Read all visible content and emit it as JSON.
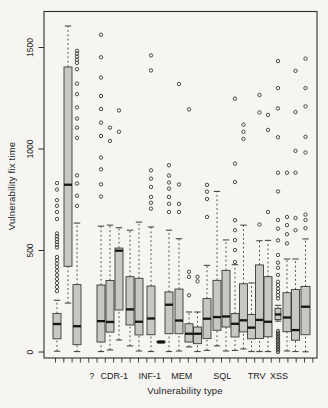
{
  "chart_data": {
    "type": "boxplot",
    "title": "",
    "xlabel": "Vulnerability type",
    "ylabel": "Vulnerability fix time",
    "ylim": [
      0,
      1680
    ],
    "grid": false,
    "legend": "none",
    "y_ticks": [
      0,
      500,
      1000,
      1500
    ],
    "categories": [
      {
        "label": "?",
        "x_px": 91.7
      },
      {
        "label": "CDR-1",
        "x_px": 114.3
      },
      {
        "label": "INF-1",
        "x_px": 149.7
      },
      {
        "label": "MEM",
        "x_px": 181.7
      },
      {
        "label": "SQL",
        "x_px": 222.3
      },
      {
        "label": "TRV",
        "x_px": 256.7
      },
      {
        "label": "XSS",
        "x_px": 279.0
      }
    ],
    "boxes": [
      {
        "group": "?",
        "x_px": 57,
        "width_px": 8,
        "whisker_low": 4,
        "q1": 65,
        "median": 138,
        "q3": 190,
        "whisker_high": 255,
        "outliers": [
          300,
          320,
          340,
          360,
          380,
          400,
          418,
          435,
          452,
          468,
          515,
          528,
          542,
          556,
          570,
          584,
          655,
          690,
          720,
          748,
          800,
          832
        ]
      },
      {
        "group": "?",
        "x_px": 68,
        "width_px": 8,
        "whisker_low": 241,
        "q1": 422,
        "median": 824,
        "q3": 1404,
        "whisker_high": 1606,
        "outliers": []
      },
      {
        "group": "?",
        "x_px": 77,
        "width_px": 8,
        "whisker_low": 2,
        "q1": 36,
        "median": 127,
        "q3": 332,
        "whisker_high": 635,
        "outliers": [
          720,
          770,
          830,
          870,
          1055,
          1105,
          1150,
          1205,
          1270,
          1322,
          1393,
          1424,
          1440,
          1455,
          1470,
          1484
        ]
      },
      {
        "group": "CDR-1",
        "x_px": 101,
        "width_px": 8,
        "whisker_low": 2,
        "q1": 49,
        "median": 152,
        "q3": 330,
        "whisker_high": 620,
        "outliers": [
          766,
          826,
          900,
          958,
          1064,
          1130,
          1197,
          1261,
          1352,
          1452,
          1563
        ]
      },
      {
        "group": "CDR-1",
        "x_px": 110,
        "width_px": 8,
        "whisker_low": 10,
        "q1": 98,
        "median": 148,
        "q3": 352,
        "whisker_high": 625,
        "outliers": [
          1040,
          1105
        ]
      },
      {
        "group": "CDR-1",
        "x_px": 119,
        "width_px": 8,
        "whisker_low": 59,
        "q1": 207,
        "median": 499,
        "q3": 512,
        "whisker_high": 612,
        "outliers": [
          1085,
          1190
        ]
      },
      {
        "group": "CDR-1",
        "x_px": 130,
        "width_px": 8,
        "whisker_low": 30,
        "q1": 133,
        "median": 210,
        "q3": 371,
        "whisker_high": 600,
        "outliers": []
      },
      {
        "group": "CDR-1",
        "x_px": 139,
        "width_px": 8,
        "whisker_low": 5,
        "q1": 84,
        "median": 149,
        "q3": 363,
        "whisker_high": 640,
        "outliers": []
      },
      {
        "group": "INF-1",
        "x_px": 151,
        "width_px": 8,
        "whisker_low": 2,
        "q1": 85,
        "median": 165,
        "q3": 325,
        "whisker_high": 616,
        "outliers": [
          706,
          735,
          764,
          813,
          854,
          895,
          1387,
          1461
        ]
      },
      {
        "group": "INF-1",
        "x_px": 161,
        "width_px": 8,
        "whisker_low": 44,
        "q1": 46,
        "median": 49,
        "q3": 53,
        "whisker_high": 55,
        "outliers": []
      },
      {
        "group": "INF-1",
        "x_px": 169,
        "width_px": 8,
        "whisker_low": 2,
        "q1": 90,
        "median": 233,
        "q3": 296,
        "whisker_high": 600,
        "outliers": [
          690,
          730,
          764,
          805,
          835,
          869,
          920
        ]
      },
      {
        "group": "INF-1",
        "x_px": 179,
        "width_px": 8,
        "whisker_low": 5,
        "q1": 90,
        "median": 155,
        "q3": 310,
        "whisker_high": 558,
        "outliers": [
          690,
          730,
          825,
          1320
        ]
      },
      {
        "group": "MEM",
        "x_px": 189,
        "width_px": 8,
        "whisker_low": 25,
        "q1": 49,
        "median": 90,
        "q3": 139,
        "whisker_high": 197,
        "outliers": [
          279,
          370,
          395,
          1195
        ]
      },
      {
        "group": "MEM",
        "x_px": 197.5,
        "width_px": 8,
        "whisker_low": 2,
        "q1": 41,
        "median": 90,
        "q3": 123,
        "whisker_high": 197,
        "outliers": [
          348,
          370
        ]
      },
      {
        "group": "MEM",
        "x_px": 207,
        "width_px": 8,
        "whisker_low": 8,
        "q1": 66,
        "median": 164,
        "q3": 263,
        "whisker_high": 427,
        "outliers": [
          665,
          754,
          790,
          823
        ]
      },
      {
        "group": "SQL",
        "x_px": 217,
        "width_px": 8,
        "whisker_low": 30,
        "q1": 107,
        "median": 172,
        "q3": 353,
        "whisker_high": 791,
        "outliers": []
      },
      {
        "group": "SQL",
        "x_px": 226,
        "width_px": 8,
        "whisker_low": 5,
        "q1": 123,
        "median": 175,
        "q3": 402,
        "whisker_high": 552,
        "outliers": []
      },
      {
        "group": "SQL",
        "x_px": 235,
        "width_px": 8,
        "whisker_low": 8,
        "q1": 74,
        "median": 139,
        "q3": 189,
        "whisker_high": 430,
        "outliers": [
          443,
          502,
          551,
          600,
          649,
          837,
          928,
          1248
        ]
      },
      {
        "group": "SQL",
        "x_px": 243.5,
        "width_px": 8,
        "whisker_low": 15,
        "q1": 99,
        "median": 156,
        "q3": 336,
        "whisker_high": 625,
        "outliers": [
          1050,
          1085,
          1120
        ]
      },
      {
        "group": "TRV",
        "x_px": 251.5,
        "width_px": 8,
        "whisker_low": 2,
        "q1": 65,
        "median": 120,
        "q3": 185,
        "whisker_high": 340,
        "outliers": []
      },
      {
        "group": "TRV",
        "x_px": 259.5,
        "width_px": 8,
        "whisker_low": 2,
        "q1": 67,
        "median": 158,
        "q3": 429,
        "whisker_high": 548,
        "outliers": [
          628,
          1180,
          1266
        ]
      },
      {
        "group": "TRV",
        "x_px": 268,
        "width_px": 8,
        "whisker_low": 2,
        "q1": 75,
        "median": 149,
        "q3": 371,
        "whisker_high": 550,
        "outliers": [
          690,
          1094,
          1168
        ]
      },
      {
        "group": "XSS",
        "x_px": 278,
        "width_px": 6,
        "whisker_low": 152,
        "q1": 160,
        "median": 185,
        "q3": 215,
        "whisker_high": 230,
        "outliers": [
          0,
          8,
          16,
          24,
          32,
          40,
          48,
          56,
          64,
          72,
          80,
          88,
          96,
          104,
          264,
          280,
          296,
          312,
          330,
          346,
          380,
          415,
          440,
          478,
          550,
          608,
          650,
          791,
          883,
          1058,
          1200,
          1300,
          1433
        ]
      },
      {
        "group": "XSS",
        "x_px": 287,
        "width_px": 8,
        "whisker_low": 5,
        "q1": 100,
        "median": 170,
        "q3": 292,
        "whisker_high": 458,
        "outliers": [
          535,
          580,
          625,
          665,
          883
        ]
      },
      {
        "group": "XSS",
        "x_px": 295.5,
        "width_px": 8,
        "whisker_low": 2,
        "q1": 58,
        "median": 108,
        "q3": 308,
        "whisker_high": 458,
        "outliers": [
          600,
          660,
          883,
          991,
          1182,
          1385
        ]
      },
      {
        "group": "XSS",
        "x_px": 305.5,
        "width_px": 9,
        "whisker_low": 1,
        "q1": 85,
        "median": 223,
        "q3": 323,
        "whisker_high": 557,
        "outliers": [
          610,
          650,
          677,
          983,
          1060,
          1210,
          1300,
          1445
        ]
      }
    ],
    "layout": {
      "frame": {
        "left": 44,
        "top": 11.5,
        "right": 317,
        "bottom": 358
      },
      "y_zero_px": 352,
      "px_per_unit": 0.203,
      "x_tick_marks": {
        "start_px": 55.5,
        "step_px": 8.3,
        "count": 32
      },
      "category_label_y_px": 379,
      "y_tick_label_x_px": 30.5
    },
    "style": {
      "background": "#f6f5f2",
      "box_fill": "#c7c7c4",
      "box_stroke": "#3a3a38",
      "median_color": "#141414",
      "whisker_color": "#3a3a38",
      "outlier_color": "#2f2f2d",
      "frame_color": "#2f2f2d",
      "text_color": "#1b1b1b"
    }
  }
}
